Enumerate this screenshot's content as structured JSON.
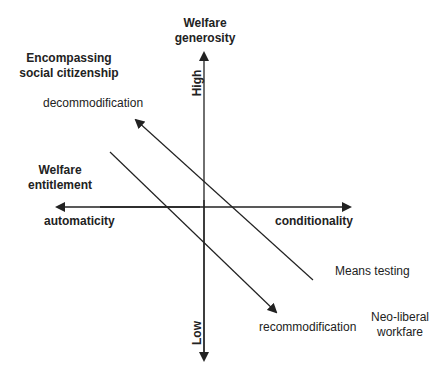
{
  "diagram": {
    "vertical_axis": {
      "title_line1": "Welfare",
      "title_line2": "generosity",
      "top_label": "High",
      "bottom_label": "Low"
    },
    "horizontal_axis": {
      "title_line1": "Welfare",
      "title_line2": "entitlement",
      "left_label": "automaticity",
      "right_label": "conditionality"
    },
    "regions": {
      "top_left_line1": "Encompassing",
      "top_left_line2": "social citizenship",
      "bottom_right_line1": "Neo-liberal",
      "bottom_right_line2": "workfare"
    },
    "arrows": {
      "decommodification": "decommodification",
      "recommodification": "recommodification",
      "means_testing": "Means testing"
    },
    "colors": {
      "line": "#222222",
      "background": "#ffffff"
    }
  }
}
